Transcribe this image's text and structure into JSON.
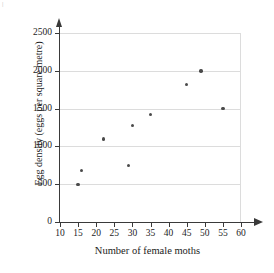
{
  "chart_data": {
    "type": "scatter",
    "title": "",
    "xlabel": "Number of female moths",
    "ylabel": "Egg density (eggs per square metre)",
    "xlim": [
      10,
      60
    ],
    "ylim": [
      0,
      2700
    ],
    "xticks": [
      10,
      15,
      20,
      25,
      30,
      35,
      40,
      45,
      50,
      55,
      60
    ],
    "yticks": [
      0,
      500,
      1000,
      1500,
      2000,
      2500
    ],
    "xtick_labels": [
      "10",
      "15",
      "20",
      "25",
      "30",
      "35",
      "40",
      "45",
      "50",
      "55",
      "60"
    ],
    "ytick_labels": [
      "0",
      "500",
      "1000",
      "1500",
      "2000",
      "2500"
    ],
    "grid": "horizontal gridlines at each y tick, plot box right and top edges",
    "legend": "none",
    "marker": "small filled dark grey circle",
    "marker_color": "#4a4a4a",
    "gridline_color": "#dcdcdc",
    "axis_color": "#3a3a3a",
    "points": [
      {
        "x": 15,
        "y": 500
      },
      {
        "x": 16,
        "y": 680
      },
      {
        "x": 22,
        "y": 1100
      },
      {
        "x": 29,
        "y": 745
      },
      {
        "x": 30,
        "y": 1280
      },
      {
        "x": 35,
        "y": 1420
      },
      {
        "x": 45,
        "y": 1820
      },
      {
        "x": 49,
        "y": 2000
      },
      {
        "x": 55,
        "y": 1500
      }
    ]
  },
  "artifact": {
    "top_left_mark": "|"
  }
}
